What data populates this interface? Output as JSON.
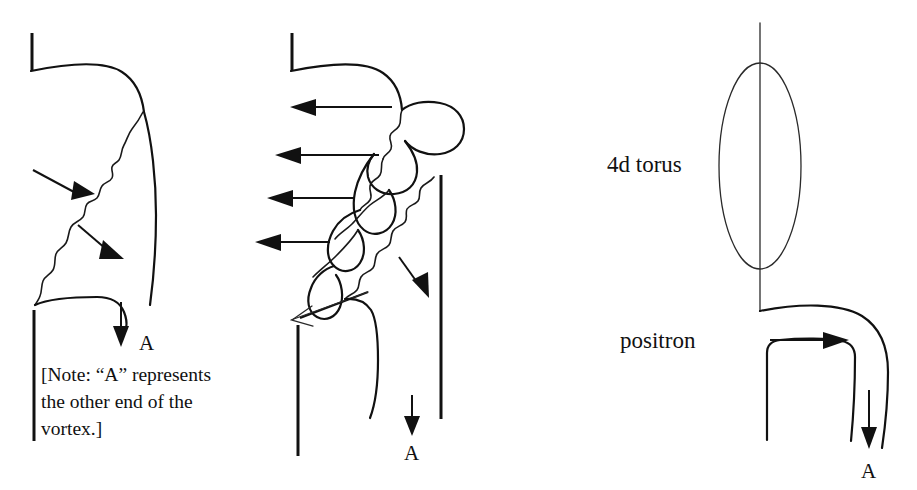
{
  "figure": {
    "background_color": "#ffffff",
    "ink_color": "#111111"
  },
  "panels": {
    "left": {
      "name": "vortex-panel-left",
      "arrow_labels": {
        "end_marker": "A"
      },
      "note": {
        "line1": "[Note: “A” represents",
        "line2": "the other end of the",
        "line3": "vortex.]",
        "full_text": "[Note: “A” represents the other end of the vortex.]"
      }
    },
    "middle": {
      "name": "vortex-panel-middle",
      "arrow_labels": {
        "end_marker": "A"
      }
    },
    "right": {
      "name": "torus-panel-right",
      "torus_label": "4d torus",
      "particle_label": "positron",
      "arrow_labels": {
        "end_marker": "A"
      }
    }
  },
  "icons": {
    "arrow_right": "arrow-right-icon",
    "arrow_left": "arrow-left-icon",
    "arrow_down": "arrow-down-icon",
    "arrow_diagonal": "arrow-diagonal-icon",
    "ellipse": "ellipse-icon"
  }
}
